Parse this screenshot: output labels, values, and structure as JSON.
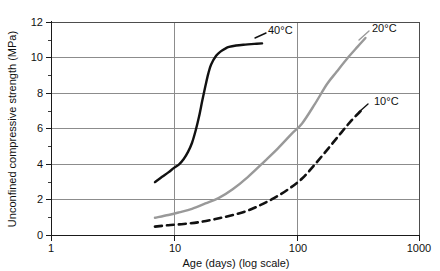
{
  "chart_data": {
    "type": "line",
    "title": "",
    "xlabel": "Age (days) (log scale)",
    "ylabel": "Unconfined compressive strength (MPa)",
    "xscale": "log",
    "xlim": [
      1,
      1000
    ],
    "ylim": [
      0,
      12
    ],
    "xticks": [
      1,
      10,
      100,
      1000
    ],
    "xtick_labels": [
      "1",
      "10",
      "100",
      "1000"
    ],
    "yticks": [
      0,
      2,
      4,
      6,
      8,
      10,
      12
    ],
    "ytick_labels": [
      "0",
      "2",
      "4",
      "6",
      "8",
      "10",
      "12"
    ],
    "grid": "horizontal-and-vertical",
    "legend_position": "inline-annotations",
    "series": [
      {
        "name": "40°C",
        "label": "40°C",
        "style": "solid",
        "color": "#111111",
        "x": [
          7,
          8,
          9,
          10,
          11,
          12,
          13,
          14,
          15,
          16,
          17,
          18,
          19,
          20,
          22,
          24,
          26,
          28,
          32,
          38,
          45,
          52
        ],
        "y": [
          3.0,
          3.3,
          3.55,
          3.8,
          4.0,
          4.3,
          4.7,
          5.2,
          5.9,
          6.7,
          7.6,
          8.4,
          9.1,
          9.6,
          10.1,
          10.35,
          10.5,
          10.6,
          10.68,
          10.73,
          10.77,
          10.8
        ]
      },
      {
        "name": "20°C",
        "label": "20°C",
        "style": "solid",
        "color": "#999999",
        "x": [
          7,
          9,
          11,
          14,
          18,
          23,
          30,
          40,
          55,
          70,
          90,
          110,
          140,
          175,
          210,
          260,
          310,
          360
        ],
        "y": [
          1.0,
          1.15,
          1.3,
          1.5,
          1.8,
          2.1,
          2.6,
          3.3,
          4.2,
          4.9,
          5.7,
          6.3,
          7.4,
          8.5,
          9.2,
          10.0,
          10.6,
          11.1
        ]
      },
      {
        "name": "10°C",
        "label": "10°C",
        "style": "dashed",
        "color": "#111111",
        "x": [
          7,
          9,
          12,
          16,
          21,
          28,
          38,
          50,
          65,
          85,
          110,
          140,
          180,
          230,
          280,
          330
        ],
        "y": [
          0.5,
          0.58,
          0.65,
          0.75,
          0.9,
          1.1,
          1.35,
          1.7,
          2.1,
          2.6,
          3.2,
          4.0,
          4.9,
          5.8,
          6.5,
          7.0
        ]
      }
    ],
    "annotations": [
      {
        "text": "40°C",
        "x_px": 268,
        "y_px": 34
      },
      {
        "text": "20°C",
        "x_px": 372,
        "y_px": 32
      },
      {
        "text": "10°C",
        "x_px": 374,
        "y_px": 105
      }
    ]
  },
  "axis": {
    "x_title": "Age (days) (log scale)",
    "y_title": "Unconfined compressive strength (MPa)"
  }
}
